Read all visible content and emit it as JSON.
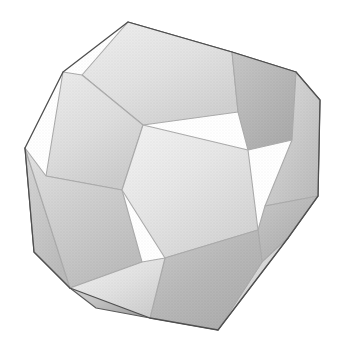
{
  "figure": {
    "title": "Dodecahedron",
    "shape_name": "dodecahedron",
    "face_count": 12,
    "face_shape": "regular pentagon",
    "rendering": "shaded 3D solid, grayscale, halftone grain",
    "background_color": "#ffffff",
    "edge_color": "#5a5a5a",
    "canvas": {
      "width": 350,
      "height": 354
    },
    "silhouette": {
      "description": "convex decagonal outline of the projected solid",
      "points": "128,22 232,52 296,72 320,100 318,196 288,238 218,330 150,318 70,288 34,252 25,148 63,72"
    },
    "faces": [
      {
        "id": "face-top",
        "label": "top pentagon",
        "tone": "light",
        "fill_start": "#d8d8d8",
        "fill_end": "#a6a6a6",
        "gradient_angle_deg": 160,
        "points": "128,22 232,52 238,112 143,125 82,75"
      },
      {
        "id": "face-upper-right",
        "label": "upper-right pentagon",
        "tone": "dark",
        "fill_start": "#8a8a8a",
        "fill_end": "#575757",
        "gradient_angle_deg": 200,
        "points": "232,52 296,72 292,140 248,150 238,112"
      },
      {
        "id": "face-upper-left",
        "label": "upper-left pentagon",
        "tone": "light",
        "fill_start": "#d4d4d4",
        "fill_end": "#9e9e9e",
        "gradient_angle_deg": 150,
        "points": "82,75 143,125 122,190 46,176 63,72"
      },
      {
        "id": "face-center",
        "label": "center pentagon",
        "tone": "lightest",
        "fill_start": "#e2e2e2",
        "fill_end": "#a8a8a8",
        "gradient_angle_deg": 135,
        "points": "143,125 248,150 258,230 165,258 122,190"
      },
      {
        "id": "face-right",
        "label": "right pentagon",
        "tone": "mid",
        "fill_start": "#b4b4b4",
        "fill_end": "#7a7a7a",
        "gradient_angle_deg": 200,
        "points": "296,72 320,100 318,196 265,206 292,140"
      },
      {
        "id": "face-left",
        "label": "left pentagon",
        "tone": "mid",
        "fill_start": "#c0c0c0",
        "fill_end": "#7e7e7e",
        "gradient_angle_deg": 140,
        "points": "46,176 122,190 142,262 70,288 25,148"
      },
      {
        "id": "face-lower-right",
        "label": "lower-right pentagon",
        "tone": "dark",
        "fill_start": "#8c8c8c",
        "fill_end": "#5c5c5c",
        "gradient_angle_deg": 215,
        "points": "258,230 265,206 318,196 288,238 262,262"
      },
      {
        "id": "face-bottom-right",
        "label": "bottom-right pentagon",
        "tone": "dark",
        "fill_start": "#8e8e8e",
        "fill_end": "#5a5a5a",
        "gradient_angle_deg": 190,
        "points": "165,258 258,230 262,262 218,330 150,318"
      },
      {
        "id": "face-bottom-left",
        "label": "bottom-left pentagon",
        "tone": "light-strip",
        "fill_start": "#dcdcdc",
        "fill_end": "#a0a0a0",
        "gradient_angle_deg": 120,
        "points": "70,288 142,262 165,258 150,318 96,308"
      },
      {
        "id": "face-left-strip",
        "label": "lower-left rim strip",
        "tone": "mid-dark",
        "fill_start": "#a8a8a8",
        "fill_end": "#787878",
        "gradient_angle_deg": 120,
        "points": "25,148 70,288 34,252"
      },
      {
        "id": "face-right-strip",
        "label": "lower-right rim strip",
        "tone": "light-strip",
        "fill_start": "#cfcfcf",
        "fill_end": "#8e8e8e",
        "gradient_angle_deg": 210,
        "points": "288,238 262,262 218,330"
      }
    ],
    "palette": {
      "lightest": "#e2e2e2",
      "light": "#c8c8c8",
      "mid": "#959595",
      "dark": "#6e6e6e",
      "darkest": "#5a5a5a"
    }
  }
}
